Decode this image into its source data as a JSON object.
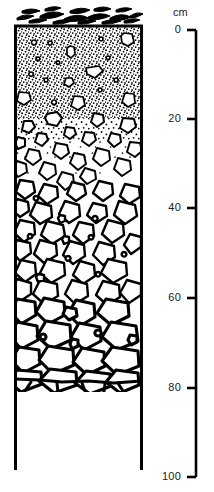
{
  "figure": {
    "name": "soil-profile-column",
    "background_color": "#ffffff",
    "ink_color": "#000000"
  },
  "depth_scale": {
    "unit_label": "cm",
    "axis_name": "depth-axis",
    "min": 0,
    "max": 100,
    "tick_interval": 20,
    "ticks": [
      {
        "value": 0,
        "label": "0",
        "y": 30
      },
      {
        "value": 20,
        "label": "20",
        "y": 119
      },
      {
        "value": 40,
        "label": "40",
        "y": 208
      },
      {
        "value": 60,
        "label": "60",
        "y": 298
      },
      {
        "value": 80,
        "label": "80",
        "y": 388
      },
      {
        "value": 100,
        "label": "100",
        "y": 477
      }
    ],
    "bar_x": 196,
    "tick_length": 9,
    "label_right_edge": 181
  },
  "column": {
    "left_x": 14,
    "right_x": 143,
    "top_y": 25,
    "bottom_y": 470,
    "border_color": "#000000",
    "border_width": 3
  },
  "horizons": [
    {
      "name": "organic-litter-layer",
      "label": "organic litter",
      "top_cm": -1,
      "bottom_cm": 0,
      "pattern": "organic-debris",
      "fill": "#ffffff"
    },
    {
      "name": "stippled-fine-matrix-horizon",
      "label": "fine stippled matrix with sparse clasts",
      "top_cm": 0,
      "bottom_cm": 20,
      "pattern": "dense-stipple",
      "fill": "#ffffff"
    },
    {
      "name": "transitional-horizon",
      "label": "matrix-supported gravel, decreasing stipple",
      "top_cm": 20,
      "bottom_cm": 33,
      "pattern": "sparse-stipple",
      "fill": "#ffffff"
    },
    {
      "name": "clast-supported-gravel-horizon",
      "label": "clast-supported gravel",
      "top_cm": 33,
      "bottom_cm": 62,
      "pattern": "pebbles",
      "fill": "#ffffff"
    },
    {
      "name": "blocky-rubble-horizon",
      "label": "coarse angular blocks / rubble",
      "top_cm": 62,
      "bottom_cm": 82,
      "pattern": "blocks",
      "fill": "#ffffff"
    },
    {
      "name": "bedrock-horizon",
      "label": "bedrock",
      "top_cm": 82,
      "bottom_cm": 100,
      "pattern": "blank",
      "fill": "#ffffff"
    }
  ]
}
